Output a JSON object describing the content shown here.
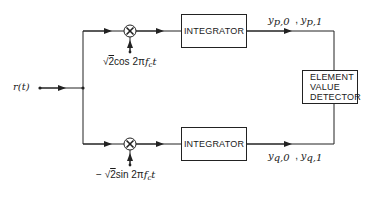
{
  "diagram": {
    "input": {
      "label": "r(t)"
    },
    "top_branch": {
      "oscillator": {
        "prefix": "√",
        "radicand": "2",
        "func": "cos 2π",
        "var": "f",
        "sub": "c",
        "tail": "t"
      },
      "integrator_label": "INTEGRATOR",
      "outputs": [
        {
          "base": "y",
          "sub": "p,0"
        },
        {
          "base": "y",
          "sub": "p,1"
        }
      ],
      "output_sep": ","
    },
    "bottom_branch": {
      "oscillator": {
        "sign": "−",
        "prefix": "√",
        "radicand": "2",
        "func": "sin 2π",
        "var": "f",
        "sub": "c",
        "tail": "t"
      },
      "integrator_label": "INTEGRATOR",
      "outputs": [
        {
          "base": "y",
          "sub": "q,0"
        },
        {
          "base": "y",
          "sub": "q,1"
        }
      ],
      "output_sep": ","
    },
    "detector": {
      "lines": [
        "ELEMENT",
        "VALUE",
        "DETECTOR"
      ]
    },
    "multiplier_symbol": "⊗",
    "colors": {
      "line": "#222222",
      "background": "#ffffff"
    }
  }
}
